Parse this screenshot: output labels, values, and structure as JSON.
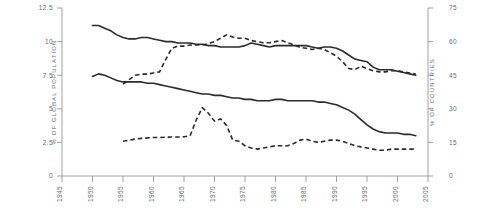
{
  "chart_data": {
    "type": "line",
    "title": "",
    "subtitle": "",
    "xlabel": "",
    "ylabel": "% OF GLOBAL POPULATION",
    "y2label": "% OF COUNTRIES",
    "xlim": [
      1945,
      2005
    ],
    "ylim": [
      0,
      12.5
    ],
    "y2lim": [
      0,
      75
    ],
    "grid": false,
    "legend": "none",
    "xticks": [
      "1945",
      "1950",
      "1955",
      "1960",
      "1965",
      "1970",
      "1975",
      "1980",
      "1985",
      "1990",
      "1995",
      "2000",
      "2005"
    ],
    "yticks": [
      "0",
      "2.5",
      "5",
      "7.5",
      "10",
      "12.5"
    ],
    "y2ticks": [
      "0",
      "15",
      "30",
      "45",
      "60",
      "75"
    ],
    "x": [
      1950,
      1951,
      1952,
      1953,
      1954,
      1955,
      1956,
      1957,
      1958,
      1959,
      1960,
      1961,
      1962,
      1963,
      1964,
      1965,
      1966,
      1967,
      1968,
      1969,
      1970,
      1971,
      1972,
      1973,
      1974,
      1975,
      1976,
      1977,
      1978,
      1979,
      1980,
      1981,
      1982,
      1983,
      1984,
      1985,
      1986,
      1987,
      1988,
      1989,
      1990,
      1991,
      1992,
      1993,
      1994,
      1995,
      1996,
      1997,
      1998,
      1999,
      2000,
      2001,
      2002,
      2003
    ],
    "series": [
      {
        "name": "global-population-upper",
        "style": "solid",
        "axis": "left",
        "units": "% of global population",
        "values": [
          11.2,
          11.2,
          11.0,
          10.8,
          10.5,
          10.3,
          10.2,
          10.2,
          10.3,
          10.3,
          10.2,
          10.1,
          10.0,
          10.0,
          9.9,
          9.9,
          9.9,
          9.8,
          9.8,
          9.7,
          9.7,
          9.6,
          9.6,
          9.6,
          9.6,
          9.7,
          9.9,
          9.8,
          9.7,
          9.6,
          9.7,
          9.7,
          9.7,
          9.7,
          9.7,
          9.7,
          9.6,
          9.5,
          9.6,
          9.6,
          9.5,
          9.3,
          9.0,
          8.7,
          8.6,
          8.5,
          8.1,
          7.9,
          7.9,
          7.9,
          7.8,
          7.7,
          7.6,
          7.5
        ]
      },
      {
        "name": "global-population-lower",
        "style": "solid",
        "axis": "left",
        "units": "% of global population",
        "values": [
          7.4,
          7.6,
          7.5,
          7.3,
          7.1,
          7.0,
          7.0,
          7.0,
          7.0,
          6.9,
          6.9,
          6.8,
          6.7,
          6.6,
          6.5,
          6.4,
          6.3,
          6.2,
          6.1,
          6.1,
          6.0,
          6.0,
          5.9,
          5.8,
          5.8,
          5.7,
          5.7,
          5.6,
          5.6,
          5.6,
          5.7,
          5.7,
          5.6,
          5.6,
          5.6,
          5.6,
          5.6,
          5.5,
          5.5,
          5.4,
          5.3,
          5.1,
          4.9,
          4.6,
          4.2,
          3.8,
          3.5,
          3.3,
          3.2,
          3.2,
          3.2,
          3.1,
          3.1,
          3.0
        ]
      },
      {
        "name": "countries-upper",
        "style": "dashed",
        "axis": "right",
        "units": "% of countries",
        "values": [
          null,
          null,
          null,
          null,
          null,
          41.0,
          43.0,
          45.0,
          45.5,
          45.5,
          46.0,
          46.5,
          52.0,
          57.0,
          58.0,
          58.0,
          58.5,
          58.5,
          58.5,
          59.0,
          60.0,
          61.5,
          63.0,
          62.0,
          61.5,
          61.5,
          60.5,
          60.0,
          59.5,
          59.5,
          60.0,
          60.5,
          59.5,
          58.5,
          57.5,
          57.0,
          56.5,
          57.0,
          56.5,
          55.0,
          53.5,
          51.0,
          48.0,
          47.5,
          49.0,
          48.0,
          47.0,
          46.5,
          46.5,
          47.0,
          47.0,
          46.5,
          46.0,
          45.5
        ]
      },
      {
        "name": "countries-lower",
        "style": "dashed",
        "axis": "right",
        "units": "% of countries",
        "values": [
          null,
          null,
          null,
          null,
          null,
          15.5,
          16.0,
          16.5,
          16.8,
          17.0,
          17.2,
          17.2,
          17.3,
          17.4,
          17.4,
          17.5,
          18.0,
          25.0,
          30.5,
          28.0,
          24.5,
          25.5,
          22.5,
          16.0,
          15.5,
          13.5,
          12.5,
          12.0,
          12.5,
          13.0,
          13.5,
          13.5,
          13.5,
          14.5,
          16.0,
          16.5,
          15.5,
          15.0,
          15.5,
          16.0,
          16.0,
          15.5,
          14.5,
          13.5,
          13.0,
          12.5,
          12.0,
          11.5,
          11.5,
          12.0,
          12.0,
          12.0,
          12.0,
          12.0
        ]
      }
    ],
    "annotations": []
  }
}
